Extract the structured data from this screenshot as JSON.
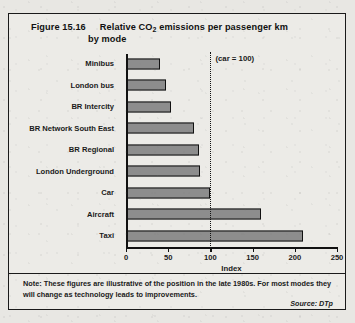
{
  "figure": {
    "number_label": "Figure 15.16",
    "title_line1_pre": "Relative CO",
    "title_line1_sub": "2",
    "title_line1_post": " emissions per passenger km",
    "title_line2": "by mode",
    "annotation": "(car = 100)",
    "note": "Note:  These figures are illustrative of the position in the late 1980s. For most modes they will change as technology leads to improvements.",
    "source": "Source: DTp",
    "bar_fill_color": "#8d8d8d",
    "bar_border_color": "#111111",
    "background_color": "#ecebe7"
  },
  "chart_data": {
    "type": "bar",
    "orientation": "horizontal",
    "categories": [
      "Minibus",
      "London bus",
      "BR Intercity",
      "BR Network South East",
      "BR Regional",
      "London Underground",
      "Car",
      "Aircraft",
      "Taxi"
    ],
    "values": [
      40,
      47,
      53,
      80,
      87,
      88,
      100,
      160,
      210
    ],
    "xlabel": "Index",
    "ylabel": "",
    "xlim": [
      0,
      250
    ],
    "xticks": [
      0,
      50,
      100,
      150,
      200,
      250
    ],
    "xtick_labels": [
      "0",
      "50",
      "100",
      "150",
      "200",
      "250"
    ],
    "grid": false,
    "legend": false,
    "reference_line": {
      "value": 100,
      "label": "(car = 100)",
      "style": "dotted"
    }
  }
}
